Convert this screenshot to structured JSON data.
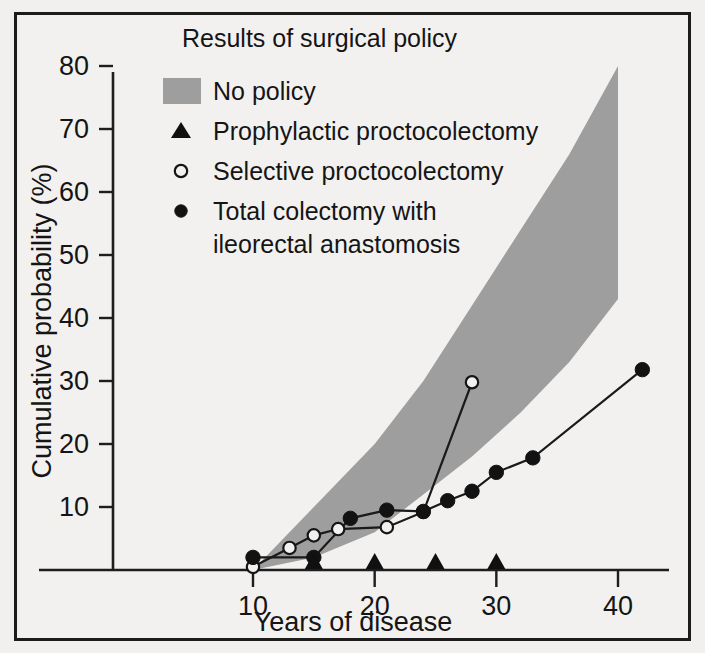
{
  "figure": {
    "title": "Results of surgical policy",
    "background_color": "#f3f1ef",
    "frame_color": "#1c1c1c"
  },
  "legend": {
    "items": [
      {
        "key": "band",
        "label": "No policy",
        "marker": "shaded-band-swatch",
        "color": "#9e9e9e"
      },
      {
        "key": "prophylactic",
        "label": "Prophylactic proctocolectomy",
        "marker": "filled-triangle",
        "color": "#101010"
      },
      {
        "key": "selective",
        "label": "Selective proctocolectomy",
        "marker": "open-circle",
        "color": "#151515"
      },
      {
        "key": "total_line1",
        "label": "Total colectomy with",
        "marker": "filled-circle",
        "color": "#121212"
      },
      {
        "key": "total_line2",
        "label": "ileorectal anastomosis",
        "marker": "none",
        "color": "#121212"
      }
    ]
  },
  "chart_data": {
    "type": "line",
    "title": "Results of surgical policy",
    "xlabel": "Years of disease",
    "ylabel": "Cumulative probability (%)",
    "xlim": [
      5,
      45
    ],
    "ylim": [
      0,
      84
    ],
    "xticks": [
      10,
      20,
      30,
      40
    ],
    "yticks": [
      10,
      20,
      30,
      40,
      50,
      60,
      70,
      80
    ],
    "grid": false,
    "legend_position": "top-left-inside",
    "series": [
      {
        "name": "No policy",
        "type": "band",
        "x": [
          10,
          15,
          20,
          24,
          28,
          32,
          36,
          40
        ],
        "upper": [
          0,
          10,
          20,
          30,
          42,
          54,
          66,
          80
        ],
        "lower": [
          0,
          2,
          6,
          12,
          18,
          25,
          33,
          43
        ]
      },
      {
        "name": "Prophylactic proctocolectomy",
        "type": "event-markers",
        "marker": "filled-triangle",
        "x": [
          15,
          20,
          25,
          30
        ],
        "y": [
          0,
          0,
          0,
          0
        ]
      },
      {
        "name": "Selective proctocolectomy",
        "type": "line",
        "marker": "open-circle",
        "x": [
          10,
          13,
          15,
          17,
          21,
          24,
          28
        ],
        "y": [
          0.5,
          3.5,
          5.5,
          6.5,
          6.8,
          9.2,
          29.8
        ]
      },
      {
        "name": "Total colectomy with ileorectal anastomosis",
        "type": "line",
        "marker": "filled-circle",
        "x": [
          10,
          15,
          18,
          21,
          24,
          26,
          28,
          30,
          33,
          42
        ],
        "y": [
          2.0,
          2.0,
          8.2,
          9.5,
          9.3,
          11.0,
          12.5,
          15.5,
          17.8,
          31.8
        ]
      }
    ]
  }
}
